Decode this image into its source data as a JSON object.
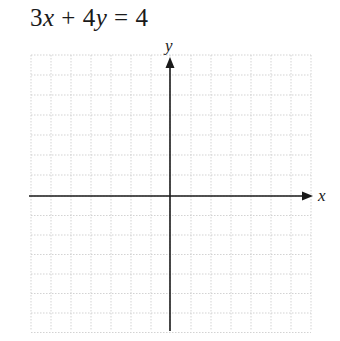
{
  "problem": {
    "equation": "3x + 4y = 4",
    "equation_parts": {
      "a": "3",
      "x": "x",
      "op": " + ",
      "b": "4",
      "y": "y",
      "eq": " = ",
      "c": "4"
    }
  },
  "graph": {
    "x_axis_label": "x",
    "y_axis_label": "y",
    "grid": {
      "x_min": -7,
      "x_max": 7,
      "y_min": -7,
      "y_max": 7,
      "step": 1
    },
    "colors": {
      "axis": "#1a1a1a",
      "grid": "#c8c8c8",
      "text": "#1a1a1a"
    }
  }
}
